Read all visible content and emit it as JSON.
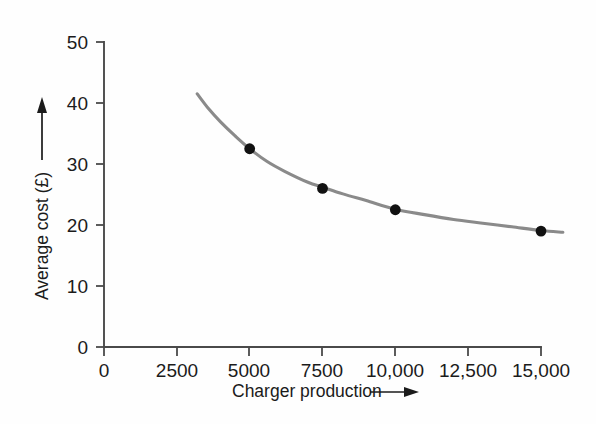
{
  "chart_data": {
    "type": "line",
    "title": "",
    "subtitle": "",
    "xlabel": "Charger production",
    "ylabel": "Average cost (£)",
    "xlim": [
      0,
      15750
    ],
    "ylim": [
      0,
      50
    ],
    "grid": false,
    "legend": "none",
    "x_ticks": [
      0,
      2500,
      5000,
      7500,
      10000,
      12500,
      15000
    ],
    "x_tick_labels": [
      "0",
      "2500",
      "5000",
      "7500",
      "10,000",
      "12,500",
      "15,000"
    ],
    "y_ticks": [
      0,
      10,
      20,
      30,
      40,
      50
    ],
    "y_tick_labels": [
      "0",
      "10",
      "20",
      "30",
      "40",
      "50"
    ],
    "series": [
      {
        "name": "Average cost curve",
        "color": "#8a8a8a",
        "kind": "curve",
        "x": [
          3200,
          3600,
          4000,
          4500,
          5000,
          5600,
          6200,
          7000,
          7500,
          8200,
          9000,
          10000,
          11000,
          12000,
          13000,
          14000,
          15000,
          15750
        ],
        "y": [
          41.5,
          39.0,
          36.9,
          34.6,
          32.5,
          30.4,
          28.8,
          27.0,
          26.2,
          25.1,
          24.0,
          22.6,
          21.7,
          20.9,
          20.3,
          19.7,
          19.1,
          18.8
        ]
      },
      {
        "name": "Plotted data points",
        "color": "#111111",
        "kind": "markers",
        "x": [
          5000,
          7500,
          10000,
          15000
        ],
        "y": [
          32.5,
          26.0,
          22.5,
          19.0
        ]
      }
    ],
    "annotations": {
      "y_axis_arrow": "upward arrow above y-axis label",
      "x_axis_arrow": "rightward arrow after x-axis label"
    }
  },
  "axis": {
    "y_title": "Average cost (£)",
    "x_title": "Charger production"
  }
}
